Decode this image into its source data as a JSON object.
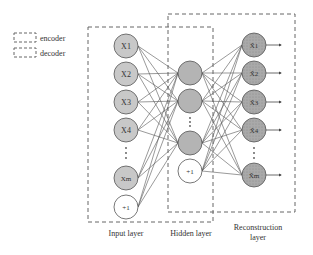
{
  "legend": {
    "items": [
      {
        "label": "encoder"
      },
      {
        "label": "decoder"
      }
    ]
  },
  "layers": {
    "input": {
      "label": "Input layer",
      "nodes": [
        "X1",
        "X2",
        "X3",
        "X4",
        "Xm",
        "+1"
      ],
      "sub": [
        "1",
        "2",
        "3",
        "4",
        "m",
        ""
      ]
    },
    "hidden": {
      "label": "Hidden layer",
      "bias": "+1"
    },
    "reconstruction": {
      "label_line1": "Reconstruction",
      "label_line2": "layer",
      "nodes": [
        "X̂1",
        "X̂2",
        "X̂3",
        "X̂4",
        "X̂m"
      ]
    }
  },
  "colors": {
    "node_fill": "#c8c8c8",
    "hidden_fill": "#b4b4b4",
    "output_fill": "#a8a8a8",
    "stroke": "#555555",
    "dash": "#666666"
  }
}
